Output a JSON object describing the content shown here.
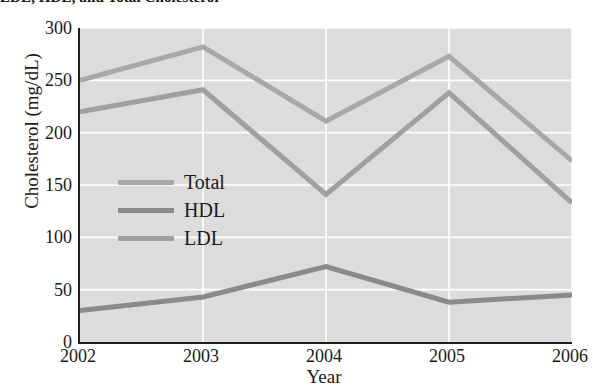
{
  "chart_data": {
    "type": "line",
    "title": "LDL, HDL, and Total Cholesterol",
    "xlabel": "Year",
    "ylabel": "Cholesterol (mg/dL)",
    "categories": [
      "2002",
      "2003",
      "2004",
      "2005",
      "2006"
    ],
    "x_tick_labels": [
      "2002",
      "2003",
      "2004",
      "2005",
      "2006"
    ],
    "y_tick_labels": [
      "0",
      "50",
      "100",
      "150",
      "200",
      "250",
      "300"
    ],
    "y_ticks": [
      0,
      50,
      100,
      150,
      200,
      250,
      300
    ],
    "ylim": [
      0,
      300
    ],
    "grid": true,
    "grid_color": "#ffffff",
    "plot_background": "#dcdcdc",
    "legend_position": "inside-left-middle",
    "series": [
      {
        "name": "Total",
        "color": "#a8a8a8",
        "values": [
          250,
          282,
          211,
          273,
          173
        ]
      },
      {
        "name": "HDL",
        "color": "#8a8a8a",
        "values": [
          30,
          43,
          72,
          38,
          45
        ]
      },
      {
        "name": "LDL",
        "color": "#a0a0a0",
        "values": [
          220,
          241,
          141,
          238,
          133
        ]
      }
    ]
  },
  "legend": {
    "entries": [
      {
        "label": "Total",
        "color": "#a8a8a8"
      },
      {
        "label": "HDL",
        "color": "#8a8a8a"
      },
      {
        "label": "LDL",
        "color": "#a0a0a0"
      }
    ]
  },
  "axes": {
    "y_label": "Cholesterol (mg/dL)",
    "x_label": "Year",
    "y_ticks": [
      "300",
      "250",
      "200",
      "150",
      "100",
      "50",
      "0"
    ],
    "x_ticks": [
      "2002",
      "2003",
      "2004",
      "2005",
      "2006"
    ]
  }
}
